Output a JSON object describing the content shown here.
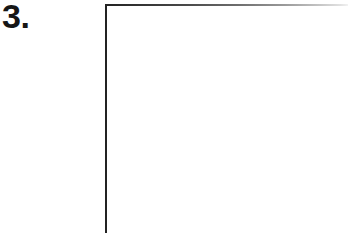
{
  "page": {
    "background_color": "#ffffff",
    "width": 348,
    "height": 233
  },
  "item": {
    "number_label": "3.",
    "number_color": "#161616"
  },
  "answer_frame": {
    "name": "blank-answer-region",
    "contents": "",
    "left_rule_color": "#232323",
    "top_rule_color_start": "#232323",
    "top_rule_color_end": "#f2f2f2",
    "interior_color": "#ffffff"
  }
}
